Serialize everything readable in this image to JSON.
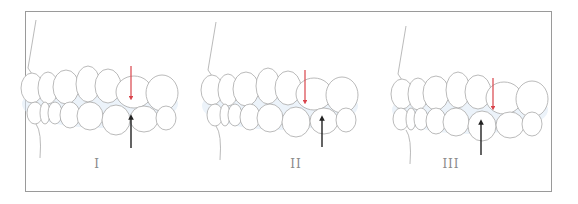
{
  "figure": {
    "type": "dental occlusion diagram",
    "panels": [
      {
        "label": "I",
        "label_x": 97,
        "red_arrow": {
          "x": 131,
          "y1": 66,
          "y2": 98
        },
        "black_arrow": {
          "x": 131,
          "y1": 148,
          "y2": 117
        },
        "offset_x": 0
      },
      {
        "label": "II",
        "label_x": 296,
        "red_arrow": {
          "x": 305,
          "y1": 70,
          "y2": 102
        },
        "black_arrow": {
          "x": 322,
          "y1": 147,
          "y2": 118
        },
        "offset_x": 180
      },
      {
        "label": "III",
        "label_x": 451,
        "red_arrow": {
          "x": 493,
          "y1": 78,
          "y2": 108
        },
        "black_arrow": {
          "x": 481,
          "y1": 155,
          "y2": 122
        },
        "offset_x": 370
      }
    ],
    "colors": {
      "frame": "#9a9a9a",
      "tooth_outline": "#a8a8a8",
      "shading": "#dde9f5",
      "red_arrow": "#d9434a",
      "black_arrow": "#222222",
      "label": "#8a8a8a"
    }
  }
}
